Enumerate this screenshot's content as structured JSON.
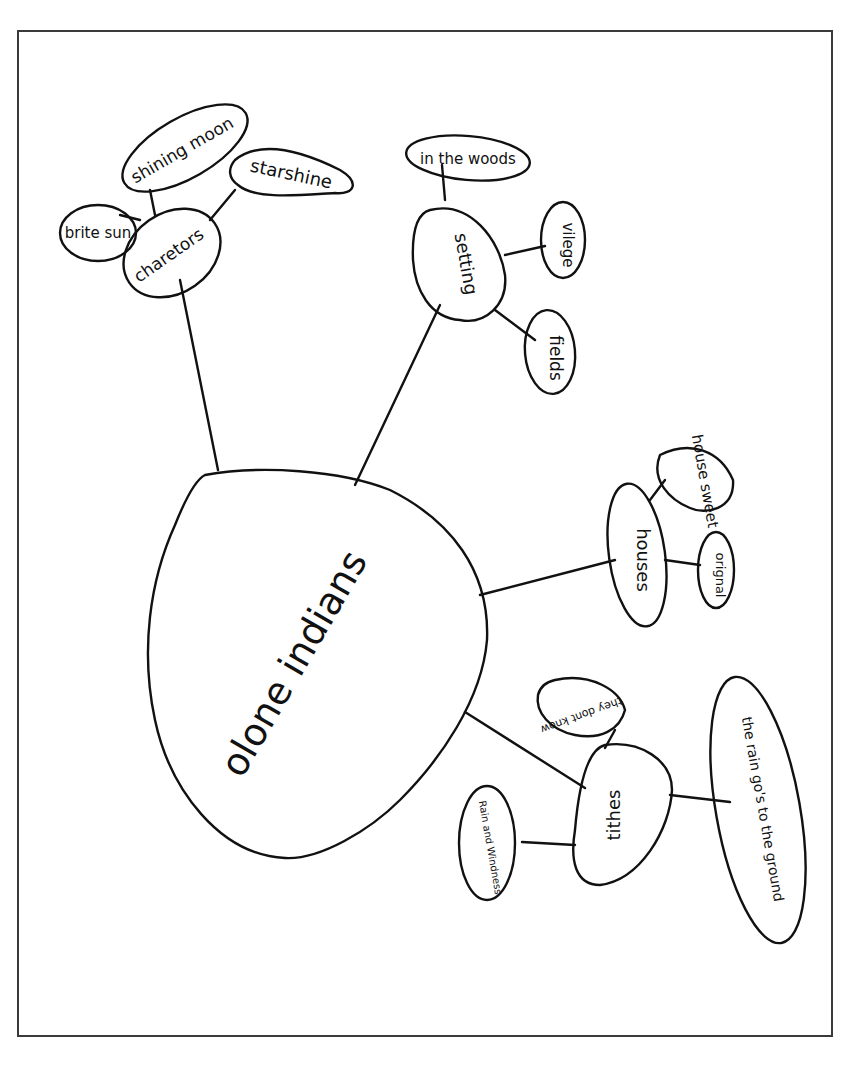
{
  "diagram": {
    "type": "mind-map",
    "style": "hand-drawn",
    "central_topic": "olone indians",
    "branches": [
      {
        "label": "charetors",
        "children": [
          "brite sun",
          "shining moon",
          "starshine"
        ]
      },
      {
        "label": "setting",
        "children": [
          "in the woods",
          "vilege",
          "fields"
        ]
      },
      {
        "label": "houses",
        "children": [
          "house sweet",
          "orignal"
        ]
      },
      {
        "label": "tithes",
        "children": [
          "they dont know",
          "Rain and Windness",
          "the rain go's to the ground"
        ]
      }
    ]
  },
  "colors": {
    "ink": "#111111",
    "paper": "#ffffff",
    "frame": "#3a3a3a"
  }
}
